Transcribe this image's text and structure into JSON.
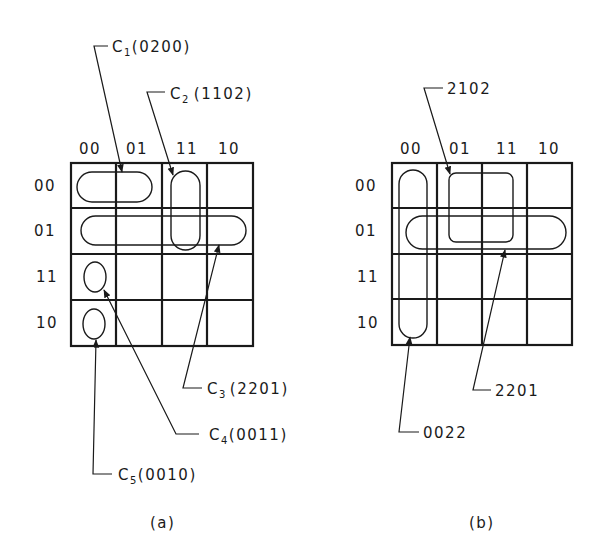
{
  "figure_a": {
    "caption": "(a)",
    "column_headers": [
      "00",
      "01",
      "11",
      "10"
    ],
    "row_headers": [
      "00",
      "01",
      "11",
      "10"
    ],
    "cubes": [
      {
        "name": "C",
        "sub": "1",
        "code": "(0200)"
      },
      {
        "name": "C",
        "sub": "2",
        "code": "(1102)"
      },
      {
        "name": "C",
        "sub": "3",
        "code": "(2201)"
      },
      {
        "name": "C",
        "sub": "4",
        "code": "(0011)"
      },
      {
        "name": "C",
        "sub": "5",
        "code": "(0010)"
      }
    ]
  },
  "figure_b": {
    "caption": "(b)",
    "column_headers": [
      "00",
      "01",
      "11",
      "10"
    ],
    "row_headers": [
      "00",
      "01",
      "11",
      "10"
    ],
    "cubes": [
      {
        "code": "2102"
      },
      {
        "code": "2201"
      },
      {
        "code": "0022"
      }
    ]
  }
}
